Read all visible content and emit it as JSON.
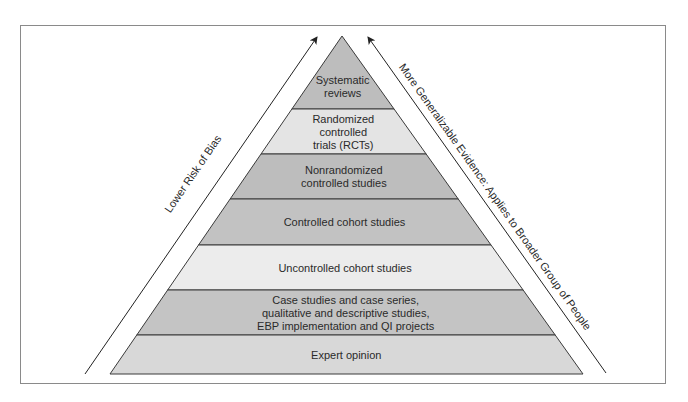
{
  "diagram": {
    "type": "evidence-pyramid",
    "levels": [
      {
        "label_lines": [
          "Systematic",
          "reviews"
        ],
        "color": "#bdbdbd"
      },
      {
        "label_lines": [
          "Randomized",
          "controlled",
          "trials (RCTs)"
        ],
        "color": "#e4e4e4"
      },
      {
        "label_lines": [
          "Nonrandomized",
          "controlled studies"
        ],
        "color": "#bdbdbd"
      },
      {
        "label_lines": [
          "Controlled cohort studies"
        ],
        "color": "#c2c2c2"
      },
      {
        "label_lines": [
          "Uncontrolled cohort studies"
        ],
        "color": "#ececec"
      },
      {
        "label_lines": [
          "Case studies and case series,",
          "qualitative and descriptive studies,",
          "EBP implementation and QI projects"
        ],
        "color": "#c4c4c4"
      },
      {
        "label_lines": [
          "Expert opinion"
        ],
        "color": "#d8d8d8"
      }
    ],
    "left_arrow_label": "Lower Risk of Bias",
    "right_arrow_label": "More Generalizable Evidence: Applies to Broader Group of People",
    "outline_color": "#3a3a3a",
    "frame_color": "#8a8a8a"
  }
}
